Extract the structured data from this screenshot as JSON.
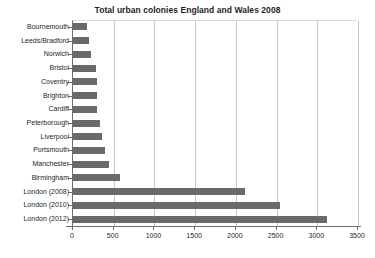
{
  "chart_data": {
    "type": "bar",
    "orientation": "horizontal",
    "title": "Total urban colonies England and Wales 2008",
    "xlabel": "",
    "ylabel": "",
    "xlim": [
      0,
      3500
    ],
    "xticks": [
      0,
      500,
      1000,
      1500,
      2000,
      2500,
      3000,
      3500
    ],
    "xtick_labels": [
      "0",
      "500",
      "1000",
      "1500",
      "2000",
      "2500",
      "3000",
      "3500"
    ],
    "grid": true,
    "legend": null,
    "bar_color": "#6a6a6a",
    "categories": [
      "Bournemouth",
      "Leeds/Bradford",
      "Norwich",
      "Bristol",
      "Coventry",
      "Brighton",
      "Cardiff",
      "Peterborough",
      "Liverpool",
      "Portsmouth",
      "Manchester",
      "Birmingham",
      "London (2008)",
      "London (2010)",
      "London (2012)"
    ],
    "values": [
      185,
      205,
      230,
      295,
      305,
      305,
      312,
      345,
      365,
      410,
      450,
      585,
      2120,
      2555,
      3135
    ]
  }
}
